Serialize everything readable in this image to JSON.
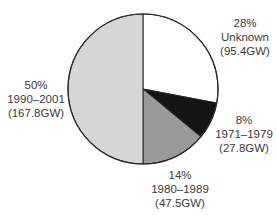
{
  "chart_data": {
    "type": "pie",
    "title": "",
    "start_angle_deg": 0,
    "direction": "clockwise",
    "slices": [
      {
        "label": "Unknown",
        "percent": 28,
        "value_gw": 95.4,
        "value_text": "(95.4GW)",
        "percent_text": "28%",
        "color": "#ffffff"
      },
      {
        "label": "1971–1979",
        "percent": 8,
        "value_gw": 27.8,
        "value_text": "(27.8GW)",
        "percent_text": "8%",
        "color": "#141414"
      },
      {
        "label": "1980–1989",
        "percent": 14,
        "value_gw": 47.5,
        "value_text": "(47.5GW)",
        "percent_text": "14%",
        "color": "#9a9a9a"
      },
      {
        "label": "1990–2001",
        "percent": 50,
        "value_gw": 167.8,
        "value_text": "(167.8GW)",
        "percent_text": "50%",
        "color": "#d6d6d6"
      }
    ],
    "categories": [
      "Unknown",
      "1971–1979",
      "1980–1989",
      "1990–2001"
    ],
    "values": [
      95.4,
      27.8,
      47.5,
      167.8
    ],
    "units": "GW",
    "legend": "none (inline labels)",
    "outline_color": "#2a2a2a"
  }
}
